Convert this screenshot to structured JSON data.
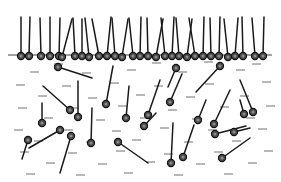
{
  "figure": {
    "width": 281,
    "height": 182,
    "background_color": "#ffffff",
    "phases": [
      {
        "name": "upper-phase",
        "label": "",
        "y_range": [
          0,
          55
        ],
        "fill": "#ffffff"
      },
      {
        "name": "lower-phase",
        "label": "",
        "y_range": [
          55,
          182
        ],
        "fill": "#ffffff"
      }
    ],
    "interface_line": {
      "name": "interface-line",
      "x1": 8,
      "y1": 55,
      "x2": 272,
      "y2": 55,
      "color": "#808080",
      "width": 1.6
    },
    "styles": {
      "head_fill": "#4a4a4a",
      "head_stroke": "#111111",
      "head_radius": 3.6,
      "head_inner_fill": "#8c8c8c",
      "head_inner_radius": 1.5,
      "tail_color": "#1a1a1a",
      "tail_width": 1.5,
      "solvent_dash_color": "#9a9a9a",
      "solvent_dash_width": 1.4,
      "solvent_dash_length": 9
    }
  },
  "adsorbed_layer": {
    "name": "adsorbed-monolayer",
    "count": 30,
    "description": "surfactant heads pinned on the interface line with tails into the upper phase",
    "molecules": [
      {
        "hx": 21,
        "hy": 56,
        "tx": 21,
        "ty": 17
      },
      {
        "hx": 29,
        "hy": 56,
        "tx": 30,
        "ty": 17
      },
      {
        "hx": 41,
        "hy": 56,
        "tx": 40,
        "ty": 18
      },
      {
        "hx": 50,
        "hy": 56,
        "tx": 50,
        "ty": 17
      },
      {
        "hx": 59,
        "hy": 56,
        "tx": 60,
        "ty": 18
      },
      {
        "hx": 62,
        "hy": 57,
        "tx": 72,
        "ty": 19
      },
      {
        "hx": 75,
        "hy": 56,
        "tx": 73,
        "ty": 18
      },
      {
        "hx": 82,
        "hy": 56,
        "tx": 82,
        "ty": 19
      },
      {
        "hx": 89,
        "hy": 57,
        "tx": 85,
        "ty": 18
      },
      {
        "hx": 99,
        "hy": 56,
        "tx": 92,
        "ty": 19
      },
      {
        "hx": 107,
        "hy": 56,
        "tx": 111,
        "ty": 17
      },
      {
        "hx": 115,
        "hy": 56,
        "tx": 112,
        "ty": 18
      },
      {
        "hx": 122,
        "hy": 57,
        "tx": 128,
        "ty": 19
      },
      {
        "hx": 133,
        "hy": 56,
        "tx": 129,
        "ty": 18
      },
      {
        "hx": 140,
        "hy": 56,
        "tx": 141,
        "ty": 17
      },
      {
        "hx": 148,
        "hy": 56,
        "tx": 147,
        "ty": 18
      },
      {
        "hx": 156,
        "hy": 57,
        "tx": 163,
        "ty": 19
      },
      {
        "hx": 165,
        "hy": 56,
        "tx": 161,
        "ty": 18
      },
      {
        "hx": 172,
        "hy": 56,
        "tx": 174,
        "ty": 17
      },
      {
        "hx": 179,
        "hy": 56,
        "tx": 176,
        "ty": 18
      },
      {
        "hx": 187,
        "hy": 57,
        "tx": 192,
        "ty": 19
      },
      {
        "hx": 195,
        "hy": 56,
        "tx": 189,
        "ty": 18
      },
      {
        "hx": 203,
        "hy": 56,
        "tx": 204,
        "ty": 17
      },
      {
        "hx": 211,
        "hy": 56,
        "tx": 210,
        "ty": 18
      },
      {
        "hx": 219,
        "hy": 56,
        "tx": 220,
        "ty": 17
      },
      {
        "hx": 228,
        "hy": 57,
        "tx": 224,
        "ty": 19
      },
      {
        "hx": 235,
        "hy": 56,
        "tx": 238,
        "ty": 18
      },
      {
        "hx": 243,
        "hy": 56,
        "tx": 242,
        "ty": 17
      },
      {
        "hx": 255,
        "hy": 56,
        "tx": 252,
        "ty": 18
      },
      {
        "hx": 263,
        "hy": 56,
        "tx": 264,
        "ty": 17
      }
    ]
  },
  "bulk_molecules": {
    "name": "bulk-surfactants",
    "count": 25,
    "description": "free surfactant molecules dispersed in the lower phase at random orientations",
    "molecules": [
      {
        "hx": 58,
        "hy": 67,
        "tx": 92,
        "ty": 78
      },
      {
        "hx": 176,
        "hy": 68,
        "tx": 168,
        "ty": 87
      },
      {
        "hx": 220,
        "hy": 66,
        "tx": 196,
        "ty": 92
      },
      {
        "hx": 106,
        "hy": 104,
        "tx": 113,
        "ty": 66
      },
      {
        "hx": 126,
        "hy": 118,
        "tx": 129,
        "ty": 86
      },
      {
        "hx": 148,
        "hy": 115,
        "tx": 160,
        "ty": 80
      },
      {
        "hx": 170,
        "hy": 102,
        "tx": 182,
        "ty": 74
      },
      {
        "hx": 70,
        "hy": 110,
        "tx": 43,
        "ty": 86
      },
      {
        "hx": 78,
        "hy": 117,
        "tx": 78,
        "ty": 81
      },
      {
        "hx": 253,
        "hy": 112,
        "tx": 240,
        "ty": 80
      },
      {
        "hx": 214,
        "hy": 124,
        "tx": 230,
        "ty": 90
      },
      {
        "hx": 215,
        "hy": 134,
        "tx": 246,
        "ty": 126
      },
      {
        "hx": 60,
        "hy": 130,
        "tx": 29,
        "ty": 148
      },
      {
        "hx": 71,
        "hy": 136,
        "tx": 60,
        "ty": 173
      },
      {
        "hx": 91,
        "hy": 143,
        "tx": 92,
        "ty": 108
      },
      {
        "hx": 118,
        "hy": 142,
        "tx": 148,
        "ty": 163
      },
      {
        "hx": 171,
        "hy": 163,
        "tx": 173,
        "ty": 123
      },
      {
        "hx": 183,
        "hy": 157,
        "tx": 194,
        "ty": 125
      },
      {
        "hx": 222,
        "hy": 158,
        "tx": 250,
        "ty": 138
      },
      {
        "hx": 244,
        "hy": 114,
        "tx": 240,
        "ty": 100
      },
      {
        "hx": 234,
        "hy": 132,
        "tx": 250,
        "ty": 128
      },
      {
        "hx": 42,
        "hy": 123,
        "tx": 42,
        "ty": 103
      },
      {
        "hx": 28,
        "hy": 140,
        "tx": 22,
        "ty": 159
      },
      {
        "hx": 144,
        "hy": 126,
        "tx": 156,
        "ty": 113
      },
      {
        "hx": 198,
        "hy": 120,
        "tx": 206,
        "ty": 100
      }
    ]
  },
  "solvent": {
    "name": "solvent-dashes",
    "count": 58,
    "description": "short horizontal gray dashes representing bulk solvent molecules",
    "positions": [
      [
        30,
        72
      ],
      [
        82,
        73
      ],
      [
        127,
        70
      ],
      [
        178,
        72
      ],
      [
        236,
        70
      ],
      [
        16,
        85
      ],
      [
        62,
        86
      ],
      [
        110,
        83
      ],
      [
        154,
        86
      ],
      [
        205,
        84
      ],
      [
        262,
        82
      ],
      [
        38,
        96
      ],
      [
        88,
        98
      ],
      [
        136,
        95
      ],
      [
        186,
        97
      ],
      [
        240,
        96
      ],
      [
        18,
        108
      ],
      [
        70,
        108
      ],
      [
        118,
        106
      ],
      [
        168,
        110
      ],
      [
        220,
        107
      ],
      [
        266,
        106
      ],
      [
        44,
        118
      ],
      [
        96,
        120
      ],
      [
        140,
        118
      ],
      [
        192,
        119
      ],
      [
        246,
        118
      ],
      [
        14,
        130
      ],
      [
        64,
        130
      ],
      [
        112,
        131
      ],
      [
        160,
        128
      ],
      [
        208,
        130
      ],
      [
        258,
        129
      ],
      [
        34,
        141
      ],
      [
        86,
        142
      ],
      [
        132,
        140
      ],
      [
        184,
        142
      ],
      [
        232,
        141
      ],
      [
        20,
        152
      ],
      [
        68,
        153
      ],
      [
        116,
        151
      ],
      [
        164,
        154
      ],
      [
        214,
        152
      ],
      [
        264,
        151
      ],
      [
        46,
        163
      ],
      [
        98,
        164
      ],
      [
        146,
        162
      ],
      [
        196,
        164
      ],
      [
        248,
        163
      ],
      [
        26,
        174
      ],
      [
        76,
        175
      ],
      [
        124,
        173
      ],
      [
        174,
        175
      ],
      [
        224,
        174
      ],
      [
        54,
        64
      ],
      [
        152,
        63
      ],
      [
        204,
        62
      ],
      [
        252,
        64
      ]
    ]
  }
}
